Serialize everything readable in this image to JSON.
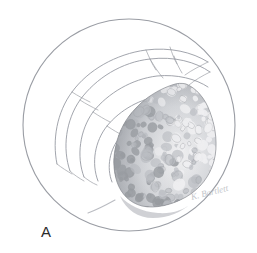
{
  "figure": {
    "panel_label": "A",
    "signature_text": "K. Bartlett",
    "background_color": "#ffffff",
    "line_color": "#8d9099",
    "circle_border_color": "#9a9da4",
    "texture_dark": "#8a8d92",
    "texture_mid": "#b8bbc0",
    "texture_light": "#efeff1",
    "shadow_color": "#9fa2a8",
    "medium": "pencil drawing"
  },
  "field_of_view": {
    "shape": "circle",
    "center_x": 129,
    "center_y": 125,
    "radius": 106,
    "stroke_width": 1.1
  },
  "contours": {
    "description": "concentric spiral leaf-fold outlines at upper left of field",
    "paths": [
      "M 57 164 C 52 140 57 112 72 92 C 88 70 116 54 146 50 C 170 47 192 52 208 62",
      "M 70 171 C 62 148 66 120 80 100 C 96 78 122 62 150 59 C 174 56 196 62 210 72",
      "M 84 177 C 76 156 80 130 93 112 C 108 93 132 79 157 76 C 177 74 196 79 208 87",
      "M 98 181 C 91 163 95 141 107 126 C 120 110 141 98 162 96 C 179 94 194 98 204 104",
      "M 112 182 C 106 167 110 149 120 137 C 131 124 148 115 165 113 C 179 112 191 115 199 120",
      "M 126 181 C 121 170 124 157 132 148 C 141 138 154 131 167 130 C 178 129 187 131 193 135"
    ],
    "radial_creases": [
      "M 146 50 C 149 57 152 64 156 70",
      "M 150 59 C 154 66 158 72 163 78",
      "M 208 62 C 200 66 192 70 185 75",
      "M 210 72 C 202 76 195 80 189 85",
      "M 57 164 C 62 168 67 171 72 174",
      "M 70 171 C 74 175 79 178 84 181",
      "M 84 177 C 88 180 92 183 97 185",
      "M 72 92 C 78 96 84 99 90 102",
      "M 80 100 C 86 104 92 107 98 110",
      "M 93 112 C 99 116 104 119 110 122",
      "M 170 47 C 172 53 174 59 177 64",
      "M 174 56 C 176 62 179 68 182 73",
      "M 107 126 C 113 130 118 133 124 136",
      "M 120 137 C 125 141 130 144 135 147",
      "M 132 148 C 137 152 142 155 147 158"
    ]
  },
  "mass": {
    "description": "granular cauliflower-like textured mass occupying right-center of field",
    "outline": "M 186 84 C 196 88 205 98 210 112 C 216 128 218 146 214 161 C 210 176 200 189 186 197 C 172 205 155 209 142 206 C 130 203 121 194 117 182 C 113 170 113 157 116 145 C 119 131 126 118 136 108 C 146 97 160 89 172 85 C 177 83 182 83 186 84 Z",
    "shadow_path": "M 120 196 C 128 205 142 212 158 213 C 172 214 184 210 190 204 C 182 212 168 218 153 218 C 138 218 126 210 120 196 Z",
    "tail_path": "M 115 200 C 106 205 96 210 88 213",
    "blob_count": 240,
    "bounds": {
      "x": 110,
      "y": 80,
      "width": 110,
      "height": 140
    }
  },
  "labels": {
    "panel": "A",
    "signature": "K. Bartlett"
  }
}
